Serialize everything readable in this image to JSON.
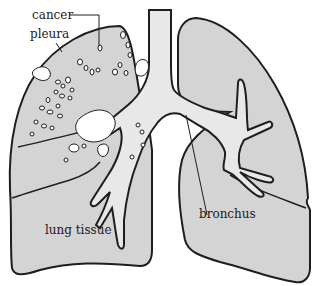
{
  "diagram": {
    "labels": {
      "cancer": "cancer",
      "pleura": "pleura",
      "lung_tissue": "lung tissue",
      "bronchus": "bronchus"
    },
    "colors": {
      "lung_fill": "#d4d4d4",
      "airway_fill": "#e8e8e8",
      "outline": "#1e1e1e",
      "tumor": "#ffffff",
      "background": "#ffffff"
    }
  }
}
